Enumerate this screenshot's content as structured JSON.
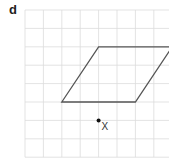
{
  "question_label": "d",
  "grid": {
    "columns": 8,
    "rows": 8,
    "line_color": "#dcdcdc"
  },
  "shape": {
    "type": "parallelogram",
    "vertices_grid": [
      [
        4,
        2
      ],
      [
        8,
        2
      ],
      [
        6,
        5
      ],
      [
        2,
        5
      ]
    ],
    "stroke_color": "#555555"
  },
  "point": {
    "label": "X",
    "grid": [
      4,
      6
    ],
    "color": "#111111"
  }
}
